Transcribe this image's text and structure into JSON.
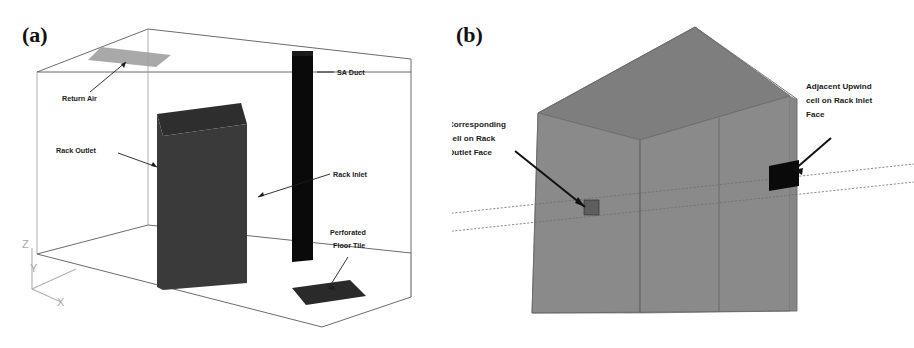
{
  "figure": {
    "panels": [
      {
        "tag": "(a)",
        "name": "room-overview",
        "annotations": [
          {
            "key": "return_air",
            "label": "Return Air",
            "lines": [
              "Return Air"
            ]
          },
          {
            "key": "sa_duct",
            "label": "SA Duct",
            "lines": [
              "SA Duct"
            ]
          },
          {
            "key": "rack_outlet",
            "label": "Rack Outlet",
            "lines": [
              "Rack Outlet"
            ]
          },
          {
            "key": "rack_inlet",
            "label": "Rack Inlet",
            "lines": [
              "Rack Inlet"
            ]
          },
          {
            "key": "perforated_tile",
            "label": "Perforated Floor Tile",
            "lines": [
              "Perforated",
              "Floor Tile"
            ]
          }
        ],
        "axes": {
          "x": "X",
          "y": "Y",
          "z": "Z"
        }
      },
      {
        "tag": "(b)",
        "name": "rack-cell-detail",
        "annotations": [
          {
            "key": "corresponding_cell",
            "label": "Corresponding cell on Rack Outlet Face",
            "lines": [
              "Corresponding",
              "cell on Rack",
              "Outlet Face"
            ]
          },
          {
            "key": "adjacent_cell",
            "label": "Adjacent Upwind cell on Rack Inlet Face",
            "lines": [
              "Adjacent Upwind",
              "cell on Rack Inlet",
              "Face"
            ]
          }
        ]
      }
    ]
  },
  "colors": {
    "background": "#ffffff",
    "rack_front": "#3a3a3a",
    "rack_top": "#2e2e2e",
    "rack_side": "#353535",
    "sa_duct": "#0a0a0a",
    "perforated_tile": "#2a2a2a",
    "return_air_vent": "#9a9a9a",
    "room_edge": "#5a5a5a",
    "rack_body_b": "#8a8a8a",
    "rack_top_b": "#7e7e7e",
    "rack_right_b": "#828282",
    "cell_outlet": "#5e5e5e",
    "cell_inlet": "#0a0a0a",
    "text": "#1c1c1c",
    "axis": "#a8a8a8"
  }
}
